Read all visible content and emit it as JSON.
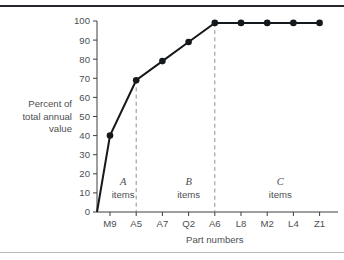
{
  "figure": {
    "background_color": "#ffffff",
    "top_rule_color": "#24282c",
    "bottom_rule_color": "#b9bcbe"
  },
  "chart_data": {
    "type": "line",
    "title": "",
    "subtitle": "",
    "xlabel": "Part numbers",
    "ylabel": "Percent of total annual value",
    "ylabel_lines": [
      "Percent of",
      "total annual",
      "value"
    ],
    "categories": [
      "M9",
      "A5",
      "A7",
      "Q2",
      "A6",
      "L8",
      "M2",
      "L4",
      "Z1"
    ],
    "values": [
      40,
      69,
      79,
      89,
      99,
      99,
      99,
      99,
      99
    ],
    "origin_value": 0,
    "x": [
      0,
      1,
      2,
      3,
      4,
      5,
      6,
      7,
      8
    ],
    "ylim": [
      0,
      100
    ],
    "ytick_labels": [
      "0",
      "10",
      "20",
      "30",
      "40",
      "50",
      "60",
      "70",
      "80",
      "90",
      "100"
    ],
    "ytick_values": [
      0,
      10,
      20,
      30,
      40,
      50,
      60,
      70,
      80,
      90,
      100
    ],
    "grid": false,
    "legend": "none",
    "series_color": "#16191c",
    "marker": "circle",
    "annotations": [
      {
        "letter": "A",
        "word": "items",
        "span": [
          "M9",
          "A5"
        ]
      },
      {
        "letter": "B",
        "word": "items",
        "span": [
          "A7",
          "A6"
        ]
      },
      {
        "letter": "C",
        "word": "items",
        "span": [
          "L8",
          "Z1"
        ]
      }
    ],
    "dividers": [
      {
        "after_category": "A5",
        "style": "dashed",
        "color": "#8d9194"
      },
      {
        "after_category": "A6",
        "style": "dashed",
        "color": "#8d9194"
      }
    ]
  }
}
